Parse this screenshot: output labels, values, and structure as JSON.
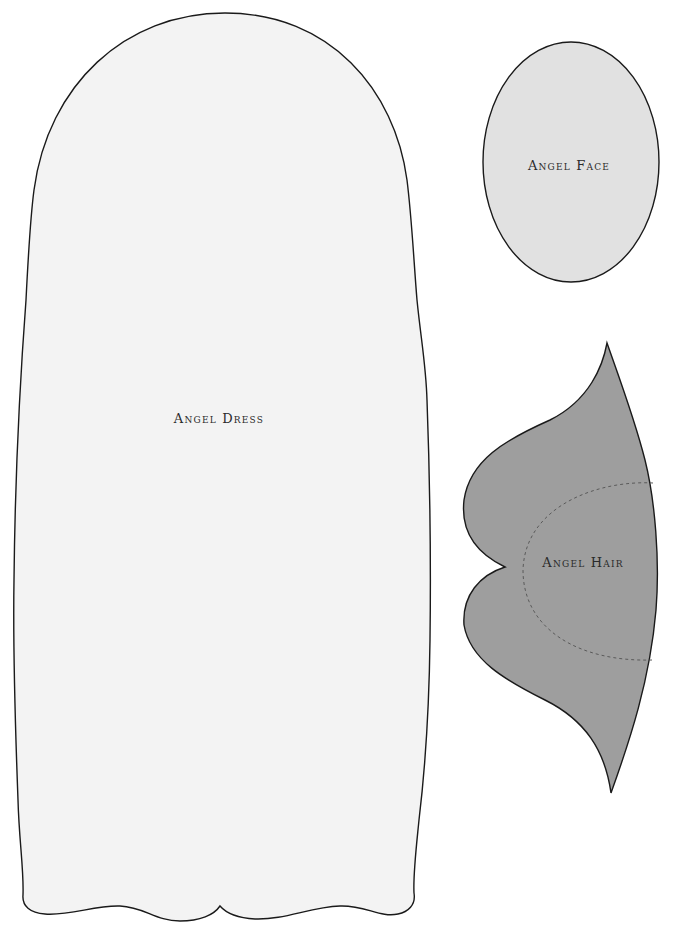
{
  "pattern_sheet": {
    "pieces": [
      {
        "id": "dress",
        "label": "Angel Dress",
        "fill": "#f3f3f3",
        "stroke": "#1a1a1a"
      },
      {
        "id": "face",
        "label": "Angel Face",
        "fill": "#e1e1e1",
        "stroke": "#1a1a1a"
      },
      {
        "id": "hair",
        "label": "Angel Hair",
        "fill": "#9e9e9e",
        "stroke": "#1a1a1a",
        "seam_line": "dashed"
      }
    ]
  }
}
